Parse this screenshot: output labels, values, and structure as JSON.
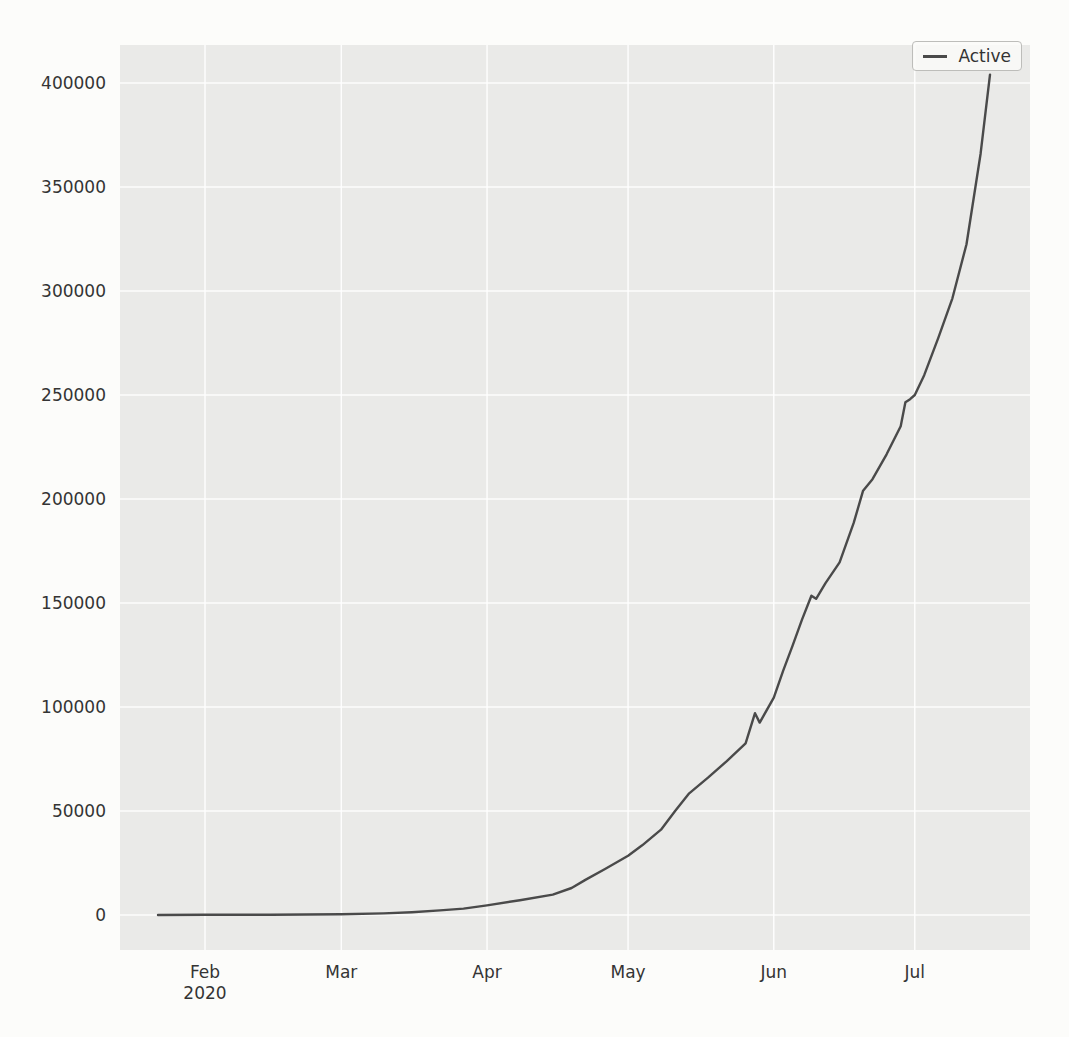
{
  "chart_data": {
    "type": "line",
    "title": "",
    "xlabel": "",
    "ylabel": "",
    "grid": true,
    "plot_background": "#eaeae8",
    "gridline_color": "#ffffff",
    "legend": {
      "position": "upper right",
      "entries": [
        {
          "label": "Active",
          "color": "#4a4a4a"
        }
      ]
    },
    "x_axis": {
      "start": "2020-01-22",
      "end": "2020-07-17",
      "ticks": [
        {
          "date": "2020-02-01",
          "label": "Feb",
          "sublabel": "2020"
        },
        {
          "date": "2020-03-01",
          "label": "Mar",
          "sublabel": ""
        },
        {
          "date": "2020-04-01",
          "label": "Apr",
          "sublabel": ""
        },
        {
          "date": "2020-05-01",
          "label": "May",
          "sublabel": ""
        },
        {
          "date": "2020-06-01",
          "label": "Jun",
          "sublabel": ""
        },
        {
          "date": "2020-07-01",
          "label": "Jul",
          "sublabel": ""
        }
      ]
    },
    "y_axis": {
      "min": 0,
      "max": 400000,
      "ticks": [
        0,
        50000,
        100000,
        150000,
        200000,
        250000,
        300000,
        350000,
        400000
      ]
    },
    "series": [
      {
        "name": "Active",
        "color": "#4a4a4a",
        "points": [
          [
            "2020-01-22",
            0
          ],
          [
            "2020-02-01",
            100
          ],
          [
            "2020-02-15",
            160
          ],
          [
            "2020-03-01",
            320
          ],
          [
            "2020-03-10",
            780
          ],
          [
            "2020-03-16",
            1350
          ],
          [
            "2020-03-22",
            2200
          ],
          [
            "2020-03-27",
            3100
          ],
          [
            "2020-04-01",
            4600
          ],
          [
            "2020-04-08",
            7100
          ],
          [
            "2020-04-15",
            9800
          ],
          [
            "2020-04-19",
            13000
          ],
          [
            "2020-04-22",
            17000
          ],
          [
            "2020-04-26",
            22000
          ],
          [
            "2020-05-01",
            28500
          ],
          [
            "2020-05-04",
            33500
          ],
          [
            "2020-05-08",
            41000
          ],
          [
            "2020-05-11",
            50000
          ],
          [
            "2020-05-14",
            58500
          ],
          [
            "2020-05-18",
            66000
          ],
          [
            "2020-05-22",
            74000
          ],
          [
            "2020-05-26",
            82500
          ],
          [
            "2020-05-28",
            97000
          ],
          [
            "2020-05-29",
            92500
          ],
          [
            "2020-06-01",
            104500
          ],
          [
            "2020-06-03",
            117500
          ],
          [
            "2020-06-05",
            129500
          ],
          [
            "2020-06-07",
            142000
          ],
          [
            "2020-06-09",
            153500
          ],
          [
            "2020-06-10",
            152000
          ],
          [
            "2020-06-12",
            159500
          ],
          [
            "2020-06-15",
            169500
          ],
          [
            "2020-06-18",
            188500
          ],
          [
            "2020-06-20",
            204000
          ],
          [
            "2020-06-22",
            209500
          ],
          [
            "2020-06-25",
            221500
          ],
          [
            "2020-06-28",
            235000
          ],
          [
            "2020-06-29",
            246500
          ],
          [
            "2020-06-30",
            248000
          ],
          [
            "2020-07-01",
            250000
          ],
          [
            "2020-07-03",
            259500
          ],
          [
            "2020-07-06",
            277500
          ],
          [
            "2020-07-09",
            296500
          ],
          [
            "2020-07-12",
            322500
          ],
          [
            "2020-07-15",
            366000
          ],
          [
            "2020-07-17",
            404000
          ]
        ]
      }
    ]
  }
}
